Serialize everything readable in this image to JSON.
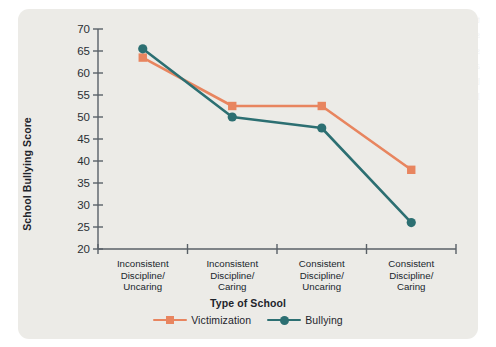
{
  "chart_data": {
    "type": "line",
    "title": "",
    "xlabel": "Type of School",
    "ylabel": "School Bullying Score",
    "categories": [
      "Inconsistent\nDiscipline/\nUncaring",
      "Inconsistent\nDiscipline/\nCaring",
      "Consistent\nDiscipline/\nUncaring",
      "Consistent\nDiscipline/\nCaring"
    ],
    "category_lines": [
      [
        "Inconsistent",
        "Discipline/",
        "Uncaring"
      ],
      [
        "Inconsistent",
        "Discipline/",
        "Caring"
      ],
      [
        "Consistent",
        "Discipline/",
        "Uncaring"
      ],
      [
        "Consistent",
        "Discipline/",
        "Caring"
      ]
    ],
    "series": [
      {
        "name": "Victimization",
        "marker": "square",
        "color": "#e8855f",
        "values": [
          63.5,
          52.5,
          52.5,
          38.0
        ]
      },
      {
        "name": "Bullying",
        "marker": "circle",
        "color": "#2c6f72",
        "values": [
          65.5,
          50.0,
          47.5,
          26.0
        ]
      }
    ],
    "ylim": [
      20,
      70
    ],
    "ytick_labels": [
      "70",
      "65",
      "60",
      "55",
      "50",
      "45",
      "40",
      "35",
      "30",
      "25",
      "20"
    ],
    "ytick_values": [
      70,
      65,
      60,
      55,
      50,
      45,
      40,
      35,
      30,
      25,
      20
    ],
    "grid": false,
    "legend_position": "bottom"
  },
  "colors": {
    "panel_background": "#ecebe7",
    "page_background": "#ffffff",
    "axis": "#5a6067",
    "text": "#1e242b",
    "victimization": "#e8855f",
    "bullying": "#2c6f72"
  },
  "ghost_text": "the school and ways to improve the climate of the school so that students are more respectful and supportive of one another. In addition, efforts to improve the quality of relationships between students and staff may be beneficial in reducing levels of bullying and victimization. Schools that are both consistent in discipline and caring toward their students report the lowest levels of school bullying, whereas schools with inconsistent discipline and an uncaring climate report the highest levels."
}
